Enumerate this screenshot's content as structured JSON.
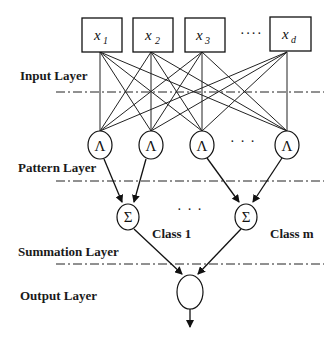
{
  "diagram": {
    "type": "probabilistic-neural-network",
    "layers": {
      "input": "Input Layer",
      "pattern": "Pattern Layer",
      "summation": "Summation Layer",
      "output": "Output Layer"
    },
    "inputs": [
      {
        "var": "x",
        "sub": "1"
      },
      {
        "var": "x",
        "sub": "2"
      },
      {
        "var": "x",
        "sub": "3"
      },
      {
        "var": "x",
        "sub": "d"
      }
    ],
    "input_ellipsis": "····",
    "pattern_node_symbol": "Λ",
    "pattern_ellipsis": "· · ·",
    "summation_node_symbol": "Σ",
    "summation_ellipsis": "· · ·",
    "classes": [
      "Class 1",
      "Class m"
    ],
    "colors": {
      "stroke": "#111111",
      "background": "#ffffff"
    }
  }
}
